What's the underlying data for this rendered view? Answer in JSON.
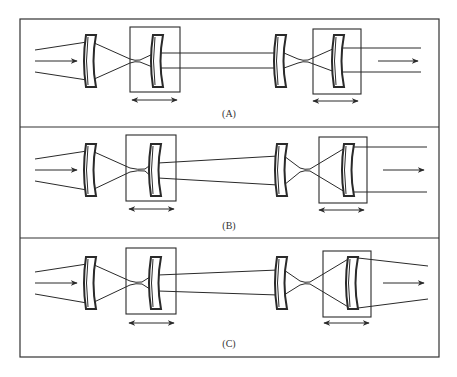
{
  "figure": {
    "colors": {
      "stroke": "#2a2a2a",
      "background": "#ffffff"
    },
    "panels": [
      {
        "id": "A",
        "label": "(A)",
        "output_beam": "collimated, narrower"
      },
      {
        "id": "B",
        "label": "(B)",
        "output_beam": "collimated, wider"
      },
      {
        "id": "C",
        "label": "(C)",
        "output_beam": "diverging"
      }
    ],
    "legend": {
      "movable_group_marker": "boxed lens",
      "translation_marker": "double-headed-arrow-icon"
    }
  }
}
